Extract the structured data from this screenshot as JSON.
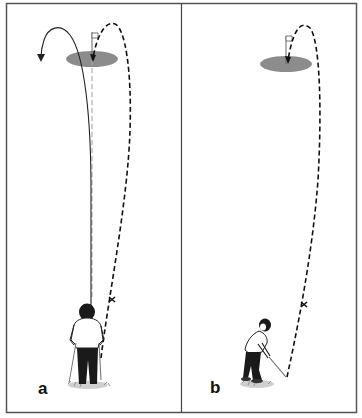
{
  "figure": {
    "panels": [
      {
        "id": "a",
        "label": "a",
        "description": "Golfer viewed from behind; solid line shows curving ball flight that hooks left past the green, dashed line shows intended fade trajectory landing on the flag; dashed grey aim line from green toward golfer; x marks an intermediate aiming point"
      },
      {
        "id": "b",
        "label": "b",
        "description": "Golfer viewed from side after impact; dashed line shows ball trajectory from club head through an x aiming point up and over onto the flag on the green"
      }
    ],
    "colors": {
      "frame": "#555555",
      "green": "#8c8c8c",
      "trajectory": "#111111",
      "aim_line": "#9a9a9a",
      "background": "#ffffff"
    },
    "markers": {
      "aim_point_symbol": "x"
    }
  }
}
